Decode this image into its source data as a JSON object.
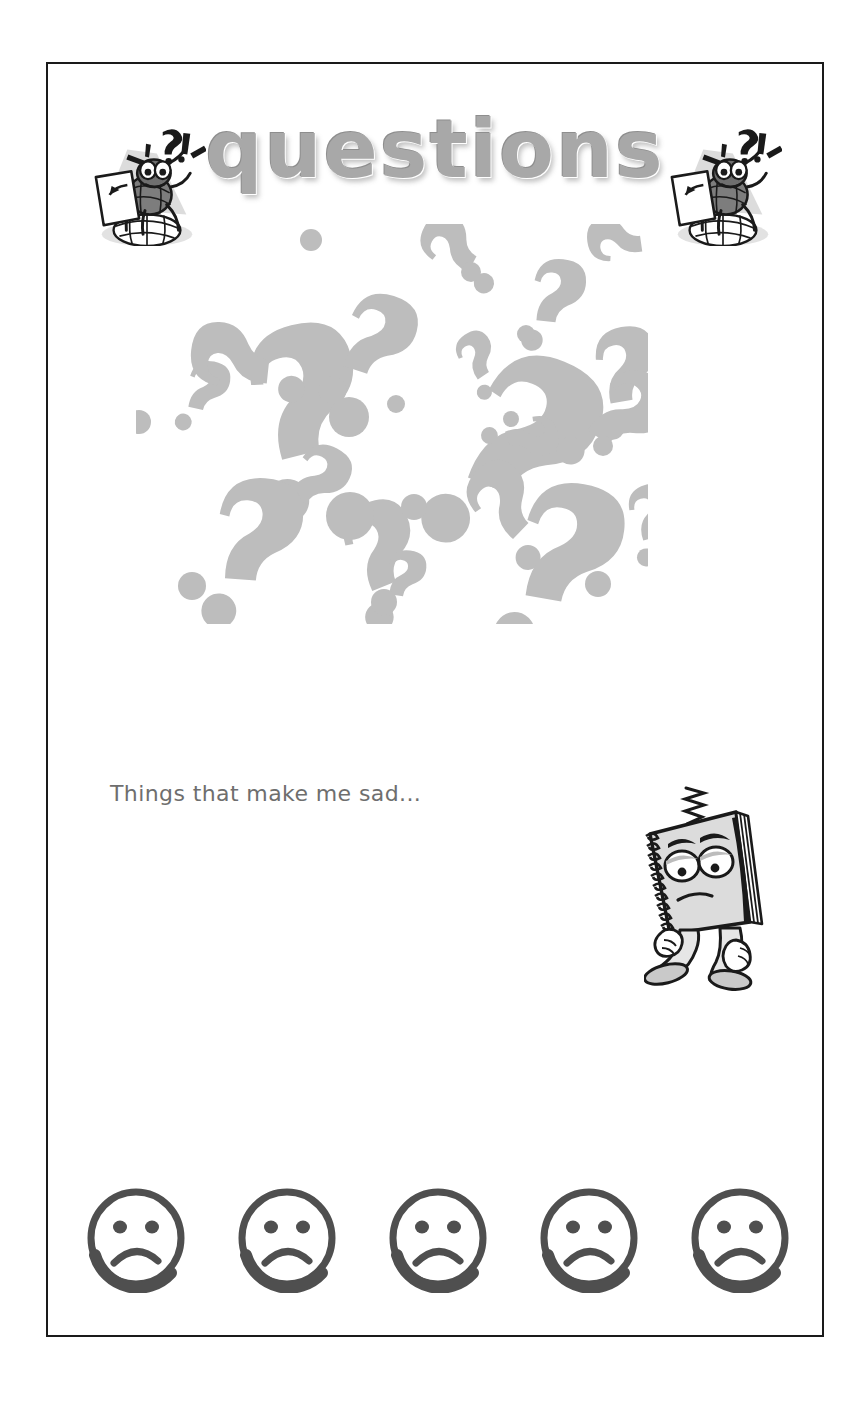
{
  "page": {
    "title": "questions",
    "border_color": "#1a1a1a",
    "background": "#ffffff"
  },
  "header": {
    "title_text": "questions",
    "title_color": "#a8a8a8",
    "decorations": [
      {
        "name": "bug-with-paper-left",
        "description": "cartoon bug holding paper with ?! above head standing on globe"
      },
      {
        "name": "bug-with-paper-right",
        "description": "cartoon bug holding paper with ?! above head standing on globe"
      }
    ]
  },
  "collage": {
    "name": "question-mark-collage",
    "description": "scattered light gray question marks at varied sizes and rotations",
    "fill_color": "#bdbdbd",
    "marks": [
      {
        "x": 60,
        "y": 120,
        "size": 150,
        "rot": -14
      },
      {
        "x": 200,
        "y": 50,
        "size": 96,
        "rot": 18
      },
      {
        "x": 265,
        "y": 42,
        "size": 70,
        "rot": -62
      },
      {
        "x": 380,
        "y": 28,
        "size": 74,
        "rot": 6
      },
      {
        "x": 455,
        "y": 58,
        "size": 62,
        "rot": -98
      },
      {
        "x": 42,
        "y": 128,
        "size": 58,
        "rot": 12
      },
      {
        "x": 300,
        "y": 128,
        "size": 52,
        "rot": -34
      },
      {
        "x": 330,
        "y": 92,
        "size": 168,
        "rot": 22
      },
      {
        "x": 430,
        "y": 110,
        "size": 86,
        "rot": -10
      },
      {
        "x": 470,
        "y": 116,
        "size": 96,
        "rot": 34
      },
      {
        "x": 46,
        "y": 185,
        "size": 92,
        "rot": -84
      },
      {
        "x": 160,
        "y": 200,
        "size": 74,
        "rot": 28
      },
      {
        "x": 52,
        "y": 245,
        "size": 120,
        "rot": 4
      },
      {
        "x": 170,
        "y": 300,
        "size": 98,
        "rot": -22
      },
      {
        "x": 240,
        "y": 320,
        "size": 54,
        "rot": 8
      },
      {
        "x": 300,
        "y": 285,
        "size": 86,
        "rot": -46
      },
      {
        "x": 360,
        "y": 240,
        "size": 140,
        "rot": 10
      },
      {
        "x": 470,
        "y": 270,
        "size": 62,
        "rot": -16
      },
      {
        "x": 410,
        "y": 170,
        "size": 58,
        "rot": 70
      }
    ],
    "dots": [
      {
        "x": 175,
        "y": 16,
        "r": 11
      },
      {
        "x": 335,
        "y": 48,
        "r": 10
      },
      {
        "x": 390,
        "y": 110,
        "r": 9
      },
      {
        "x": 3,
        "y": 198,
        "r": 12
      },
      {
        "x": 260,
        "y": 180,
        "r": 9
      },
      {
        "x": 213,
        "y": 193,
        "r": 20
      },
      {
        "x": 375,
        "y": 195,
        "r": 8
      },
      {
        "x": 214,
        "y": 292,
        "r": 24
      },
      {
        "x": 278,
        "y": 283,
        "r": 13
      },
      {
        "x": 467,
        "y": 222,
        "r": 10
      },
      {
        "x": 56,
        "y": 362,
        "r": 14
      },
      {
        "x": 248,
        "y": 378,
        "r": 13
      },
      {
        "x": 462,
        "y": 360,
        "r": 13
      }
    ]
  },
  "prompt": {
    "text": "Things that make me sad...",
    "color": "#6e6e6e"
  },
  "mascot": {
    "name": "sad-notebook-character",
    "description": "sad spiral notebook character with droopy eyes, frown, walking legs and a squiggle above its head"
  },
  "rating": {
    "name": "sad-face-rating-row",
    "face_color": "#4f4f4f",
    "count": 5,
    "faces": [
      {
        "label": "sad-face-1",
        "expression": "sad"
      },
      {
        "label": "sad-face-2",
        "expression": "sad"
      },
      {
        "label": "sad-face-3",
        "expression": "sad"
      },
      {
        "label": "sad-face-4",
        "expression": "sad"
      },
      {
        "label": "sad-face-5",
        "expression": "sad"
      }
    ]
  }
}
